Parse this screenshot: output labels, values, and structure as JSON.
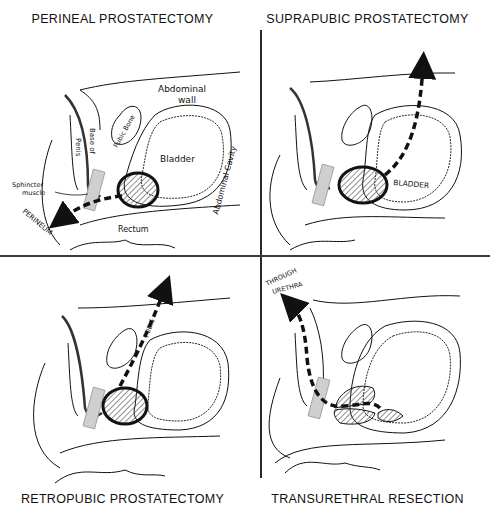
{
  "figure": {
    "panels": [
      {
        "id": "perineal",
        "title": "PERINEAL PROSTATECTOMY",
        "labels": {
          "abdominal_wall_1": "Abdominal",
          "abdominal_wall_2": "wall",
          "pubic_bone": "Pubic Bone",
          "base_of": "Base of",
          "penis": "Penis",
          "bladder": "Bladder",
          "abdominal_cavity": "Abdominal Cavity",
          "sphincter_1": "Sphincter",
          "sphincter_2": "muscle",
          "rectum": "Rectum",
          "perineum": "PERINEUM"
        },
        "route": "arrow from prostate down-left to perineum"
      },
      {
        "id": "suprapubic",
        "title": "SUPRAPUBIC PROSTATECTOMY",
        "labels": {
          "bladder": "BLADDER"
        },
        "route": "arrow from prostate up through bladder and abdominal wall"
      },
      {
        "id": "retropubic",
        "title": "RETROPUBIC PROSTATECTOMY",
        "labels": {
          "pubis": "PUBIS"
        },
        "route": "arrow from prostate up behind pubic bone"
      },
      {
        "id": "transurethral",
        "title": "TRANSURETHRAL RESECTION",
        "labels": {
          "through_1": "THROUGH",
          "through_2": "URETHRA"
        },
        "route": "arrow from prostate out through urethra"
      }
    ],
    "colors": {
      "ink": "#111111",
      "paper": "#ffffff",
      "hatch": "#444444",
      "sphincter": "#cfcfcf"
    }
  }
}
